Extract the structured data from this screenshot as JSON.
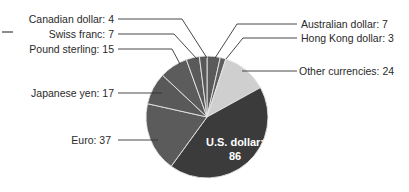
{
  "chart_data": {
    "type": "pie",
    "title": "",
    "start_angle_deg": 0,
    "direction": "clockwise",
    "total": 200,
    "slices": [
      {
        "label": "Australian dollar",
        "value": 7,
        "color": "#5a5a5a",
        "text": "Australian dollar: 7"
      },
      {
        "label": "Hong Kong dollar",
        "value": 3,
        "color": "#5e5e5e",
        "text": "Hong Kong dollar: 3"
      },
      {
        "label": "Other currencies",
        "value": 24,
        "color": "#cfcfcf",
        "text": "Other currencies: 24"
      },
      {
        "label": "U.S. dollar",
        "value": 86,
        "color": "#3b3b3b",
        "text": "U.S. dollar: 86",
        "inside_label": [
          "U.S. dollar:",
          "86"
        ]
      },
      {
        "label": "Euro",
        "value": 37,
        "color": "#5b5b5b",
        "text": "Euro: 37"
      },
      {
        "label": "Japanese yen",
        "value": 17,
        "color": "#595959",
        "text": "Japanese yen: 17"
      },
      {
        "label": "Pound sterling",
        "value": 15,
        "color": "#5c5c5c",
        "text": "Pound sterling: 15"
      },
      {
        "label": "Swiss franc",
        "value": 7,
        "color": "#5a5a5a",
        "text": "Swiss franc: 7"
      },
      {
        "label": "Canadian dollar",
        "value": 4,
        "color": "#585858",
        "text": "Canadian dollar: 4"
      }
    ],
    "separator_color": "#e8e8e8",
    "leader_line_color": "#333333",
    "legend": "none"
  },
  "geometry": {
    "cx": 207,
    "cy": 117,
    "r": 61
  },
  "labels": {
    "canadian": "Canadian dollar: 4",
    "swiss": "Swiss franc: 7",
    "pound": "Pound sterling: 15",
    "yen": "Japanese yen: 17",
    "euro": "Euro: 37",
    "australian": "Australian dollar: 7",
    "hongkong": "Hong Kong dollar: 3",
    "other": "Other currencies: 24",
    "usd_line1": "U.S. dollar:",
    "usd_line2": "86"
  }
}
